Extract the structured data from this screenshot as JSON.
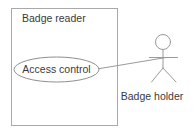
{
  "diagram": {
    "kind": "uml-use-case-diagram",
    "background_color": "#ffffff",
    "line_color": "#9a9a9a",
    "text_color": "#3a3a3a",
    "system_boundary": {
      "label": "Badge reader",
      "shape": "rectangle"
    },
    "use_cases": [
      {
        "label": "Access control",
        "shape": "ellipse"
      }
    ],
    "actors": [
      {
        "label": "Badge holder",
        "shape": "stick-figure"
      }
    ],
    "associations": [
      {
        "from": "Access control",
        "to": "Badge holder",
        "style": "solid-line"
      }
    ]
  }
}
